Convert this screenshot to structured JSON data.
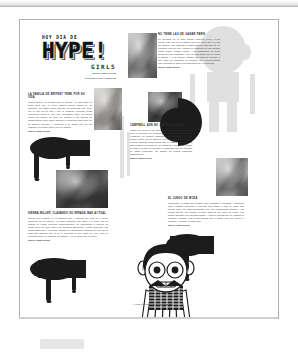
{
  "document": {
    "kind": "scanned-magazine-page",
    "language": "es"
  },
  "masthead": {
    "eyebrow": "HOY DIA DE",
    "title": "HYPE!",
    "subtitle": "GIRLS",
    "credit_line1": "TEXTO: REDACCION",
    "credit_line2": "FOTOGRAFIAS: AGENCIAS"
  },
  "articles": [
    {
      "id": "article-britney",
      "headline": "LA FAMILIA DE BRITNEY TEME POR SU VIDA",
      "body": "Padres Britney no dejaba para la prensa y le han dado un aviso para que la joven estrella pueda hablar de su situacion. Su padre Jamie Spears ha declarado que teme por la vida de su hija y que la cantante necesita ayuda profesional antes de que sea demasiado tarde. La familia entera ha pedido un poco de respeto a los medios de comunicacion para poder afrontar el momento mas dificil de su historia reciente y recuperar a la artista que un dia enamoro al mundo entero con su musica.",
      "kicker": "TEXTO: REDACCION"
    },
    {
      "id": "article-paris",
      "headline": "NO TIENE LAS DE GANAR PARIS",
      "body": "La heredera de la gran fortuna hotelera vuelve a ser noticia, esta vez por un asunto que poco tiene que ver con las fiestas. Las camaras la sorprendieron saliendo de un conocido local de Los Angeles en compania de sus amigas Nicole Richie, Lindsay Lohan y Kim Kardashian. La joven afirma que ha cambiado y que su vida ahora gira en torno al trabajo y a su familia, aunque los rumores apuntan a que nada ha cambiado en realidad. Sus representantes han preferido no hacer declaraciones por el momento.",
      "kicker": "TEXTO: REDACCION"
    },
    {
      "id": "article-naomi",
      "headline": "CAMPBELL AUN NO SE HA CALMADO",
      "body": "Naomi ha vuelto a los tribunales por un nuevo incidente con un miembro del personal de tierra del aeropuerto de Heathrow. La modelo britanica, conocida tanto por sus desfiles como por su caracter, tuvo que pagar una multa y realizar trabajos comunitarios tras el episodio anterior. En esta ocasion la policia se vio obligada a intervenir cuando la modelo perdio los nervios al comprobar que su equipaje se habia extraviado. Su agente ha pedido disculpas publicamente.",
      "kicker": "TEXTO: REDACCION"
    },
    {
      "id": "article-sienna",
      "headline": "SIENNA MILLER, CLAVANDO SU MIRADA MAS ACTUAL",
      "body": "Sienna luce radiante en la alfombra roja y confiesa que esta en el mejor momento de su carrera. La actriz britanica, que saltó a la fama por su trabajo en varias peliculas independientes, ha comenzado a disenar su propia linea de ropa junto a su hermana Savannah. Ambas defienden una moda sostenible y accesible, alejada de los grandes nombres del lujo. En la entrevista asegura que ya no le preocupa lo que digan de ella y que su prioridad ahora es disfrutar del trabajo y de la gente que la rodea.",
      "kicker": "TEXTO: REDACCION"
    },
    {
      "id": "article-body",
      "headline": "EL JUEGO DE MODA",
      "body": "Conocidas en todas las revistas, pero visitadas a arriesgar y combinar largo vestidos, diferentes a comprar para todos el look de fiesta. Las piezas clave de esta temporada son los estampados florales y los tejidos ligeros, que pueden llevarse tanto de dia como de noche. Las firmas apuestan por siluetas fluidas y colores neutros que se adaptan a cualquier ocasion. Los complementos son el toque final que define el conjunto y marcan la diferencia.",
      "kicker": "TEXTO: REDACCION"
    }
  ],
  "footer": {
    "caption": "HYPE! La revista de las chicas",
    "page_number": "p.014"
  },
  "colors": {
    "ink": "#1c1c1c",
    "paper": "#ffffff",
    "text": "#3a3a3a",
    "watermark": "#9a9a9a",
    "page_border": "#b0b0b0"
  }
}
